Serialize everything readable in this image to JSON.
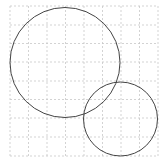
{
  "diagram": {
    "type": "geometry-circles-on-grid",
    "background": "#ffffff",
    "grid": {
      "x_lines": [
        10,
        28.5,
        47,
        65.5,
        84,
        102.5,
        121,
        139.5,
        158
      ],
      "y_lines": [
        6,
        25,
        43.5,
        62,
        81,
        99.5,
        118,
        137,
        156
      ],
      "color": "#c8c8c8",
      "dash": "2,2"
    },
    "circles": [
      {
        "name": "large-circle",
        "cx": 65,
        "cy": 62.5,
        "r": 55,
        "stroke": "#444444"
      },
      {
        "name": "small-circle",
        "cx": 120.5,
        "cy": 119,
        "r": 37,
        "stroke": "#444444"
      }
    ]
  }
}
